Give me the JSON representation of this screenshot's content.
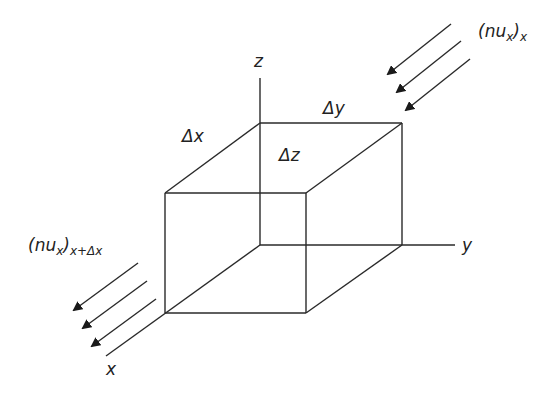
{
  "diagram": {
    "type": "control-volume-cube",
    "axes": {
      "x": "x",
      "y": "y",
      "z": "z"
    },
    "dimensions": {
      "dx": "Δx",
      "dy": "Δy",
      "dz": "Δz"
    },
    "flux_in": {
      "base": "(nu",
      "inner_sub": "x",
      "close": ")",
      "outer_sub": "x"
    },
    "flux_out": {
      "base": "(nu",
      "inner_sub": "x",
      "close": ")",
      "outer_sub": "x+Δx"
    },
    "line_color": "#2a2a2a"
  }
}
